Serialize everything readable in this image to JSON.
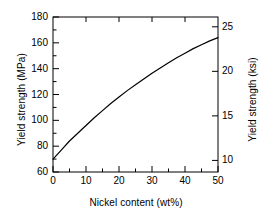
{
  "chart_data": {
    "type": "line",
    "title": "",
    "subtitle": "",
    "xlabel": "Nickel content (wt%)",
    "ylabel": "Yield strength (MPa)",
    "y2label": "Yield strength (ksi)",
    "xlim": [
      0,
      50
    ],
    "ylim": [
      60,
      180
    ],
    "y2lim": [
      8.7,
      26.1
    ],
    "grid": false,
    "legend": null,
    "xticks": [
      0,
      10,
      20,
      30,
      40,
      50
    ],
    "xtick_labels": [
      "0",
      "10",
      "20",
      "30",
      "40",
      "50"
    ],
    "x_minor_ticks": [
      5,
      15,
      25,
      35,
      45
    ],
    "yticks": [
      60,
      80,
      100,
      120,
      140,
      160,
      180
    ],
    "ytick_labels": [
      "60",
      "80",
      "100",
      "120",
      "140",
      "160",
      "180"
    ],
    "y_minor_ticks": [
      70,
      90,
      110,
      130,
      150,
      170
    ],
    "y2ticks": [
      10,
      15,
      20,
      25
    ],
    "y2tick_labels": [
      "10",
      "15",
      "20",
      "25"
    ],
    "series": [
      {
        "name": "Yield strength vs nickel content",
        "color": "#000000",
        "x": [
          0,
          2.5,
          5,
          7.5,
          10,
          12.5,
          15,
          17.5,
          20,
          22.5,
          25,
          27.5,
          30,
          32.5,
          35,
          37.5,
          40,
          42.5,
          45,
          47.5,
          50
        ],
        "y": [
          70,
          77,
          84,
          90,
          96,
          102,
          107.5,
          113,
          118,
          123,
          127.5,
          132,
          136.5,
          140.5,
          144.5,
          148.5,
          152,
          155.5,
          158.5,
          161.5,
          164
        ]
      }
    ]
  },
  "axes": {
    "left": {
      "title": "Yield strength (MPa)",
      "labels": [
        "180",
        "160",
        "140",
        "120",
        "100",
        "80",
        "60"
      ]
    },
    "right": {
      "title": "Yield strength (ksi)",
      "labels": [
        "25",
        "20",
        "15",
        "10"
      ]
    },
    "bottom": {
      "title": "Nickel content (wt%)",
      "labels": [
        "0",
        "10",
        "20",
        "30",
        "40",
        "50"
      ]
    }
  },
  "colors": {
    "curve": "#000000",
    "axis": "#000000",
    "background": "#ffffff"
  }
}
